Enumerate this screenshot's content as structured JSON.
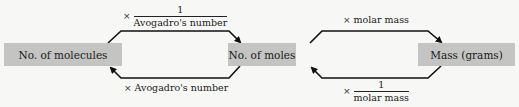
{
  "boxes": {
    "molecules": "No. of molecules",
    "moles": "No. of moles",
    "mass": "Mass (grams)"
  },
  "conversions": {
    "molecules_to_moles": {
      "operator": "×",
      "numerator": "1",
      "denominator": "Avogadro's number"
    },
    "moles_to_molecules": {
      "operator": "×",
      "text": "Avogadro's number"
    },
    "moles_to_mass": {
      "operator": "×",
      "text": "molar mass"
    },
    "mass_to_moles": {
      "operator": "×",
      "numerator": "1",
      "denominator": "molar mass"
    }
  },
  "colors": {
    "box_fill": "#c4c4c2",
    "arrow": "#111111",
    "background": "#f7f7f5"
  }
}
